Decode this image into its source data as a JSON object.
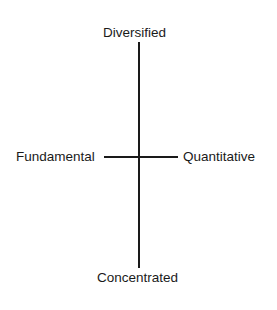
{
  "diagram": {
    "axes": {
      "top": "Diversified",
      "bottom": "Concentrated",
      "left": "Fundamental",
      "right": "Quantitative"
    }
  }
}
